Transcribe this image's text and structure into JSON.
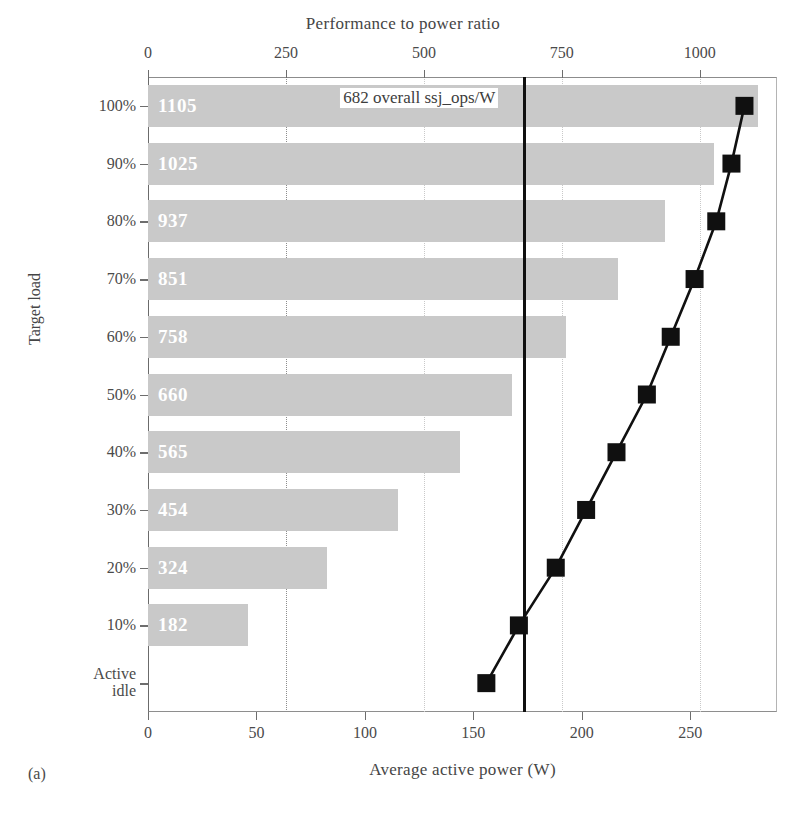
{
  "figure": {
    "panel_label": "(a)",
    "top_axis_title": "Performance to power ratio",
    "bottom_axis_title": "Average active power (W)",
    "y_axis_title": "Target load",
    "overall_annotation": "682 overall ssj_ops/W"
  },
  "chart_data": {
    "type": "bar",
    "title": "Performance to power ratio",
    "xlabel": "Average active power (W)",
    "ylabel": "Target load",
    "grid": true,
    "legend": "none",
    "categories": [
      "100%",
      "90%",
      "80%",
      "70%",
      "60%",
      "50%",
      "40%",
      "30%",
      "20%",
      "10%",
      "Active idle"
    ],
    "bar_axis": {
      "name": "Performance to power ratio",
      "position": "top",
      "ticks": [
        0,
        250,
        500,
        750,
        1000
      ],
      "tick_labels": [
        "0",
        "250",
        "500",
        "750",
        "1000"
      ],
      "lim": [
        0,
        1140
      ]
    },
    "line_axis": {
      "name": "Average active power (W)",
      "position": "bottom",
      "ticks": [
        0,
        50,
        100,
        150,
        200,
        250
      ],
      "tick_labels": [
        "0",
        "50",
        "100",
        "150",
        "200",
        "250"
      ],
      "lim": [
        0,
        290
      ]
    },
    "series": [
      {
        "name": "Performance to power ratio (ssj_ops/W)",
        "type": "bar",
        "axis": "top",
        "values": [
          1105,
          1025,
          937,
          851,
          758,
          660,
          565,
          454,
          324,
          182,
          null
        ],
        "labels": [
          "1105",
          "1025",
          "937",
          "851",
          "758",
          "660",
          "565",
          "454",
          "324",
          "182",
          ""
        ]
      },
      {
        "name": "Average active power (W)",
        "type": "line",
        "axis": "bottom",
        "marker": "square",
        "values": [
          275,
          269,
          262,
          252,
          241,
          230,
          216,
          202,
          188,
          171,
          156
        ]
      }
    ],
    "reference_line": {
      "label": "682 overall ssj_ops/W",
      "value": 682,
      "axis": "top",
      "orientation": "vertical"
    },
    "colors": {
      "bar_fill": "#c9c9c9",
      "bar_label": "#ffffff",
      "line": "#101010",
      "reference_line": "#101010",
      "grid": "#c9c9c9",
      "text": "#454545"
    }
  }
}
